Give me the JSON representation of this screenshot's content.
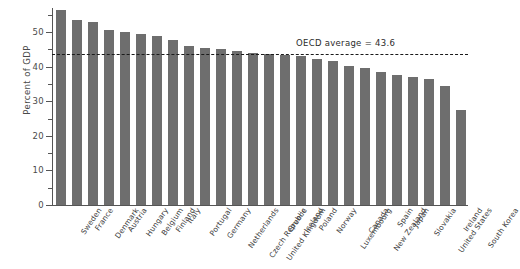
{
  "chart_data": {
    "type": "bar",
    "title": "",
    "xlabel": "",
    "ylabel": "Percent of GDP",
    "ylim": [
      0,
      57
    ],
    "yticks": [
      0,
      10,
      20,
      30,
      40,
      50
    ],
    "ytick_labels": [
      "0",
      "10",
      "20",
      "30",
      "40",
      "50"
    ],
    "grid": false,
    "legend": null,
    "bar_color": "#6e6e6e",
    "categories": [
      "Sweden",
      "France",
      "Denmark",
      "Austria",
      "Hungary",
      "Belgium",
      "Finland",
      "Italy",
      "Portugal",
      "Germany",
      "Netherlands",
      "Czech Republic",
      "United Kingdom",
      "Greece",
      "Iceland",
      "Poland",
      "Norway",
      "Luxembourg",
      "Canada",
      "New Zealand",
      "Spain",
      "Japan",
      "Slovakia",
      "United States",
      "Ireland",
      "South Korea"
    ],
    "values": [
      56.4,
      53.4,
      53.0,
      50.5,
      50.1,
      49.4,
      48.8,
      47.7,
      46.1,
      45.4,
      45.0,
      44.6,
      44.1,
      43.6,
      43.4,
      43.1,
      42.3,
      41.6,
      40.2,
      39.6,
      38.6,
      37.6,
      36.9,
      36.5,
      34.3,
      27.6
    ],
    "annotations": [
      {
        "name": "oecd-average-line",
        "label": "OECD average  =  43.6",
        "value": 43.6,
        "style": "dashed",
        "color": "#1a1a1a"
      }
    ]
  }
}
